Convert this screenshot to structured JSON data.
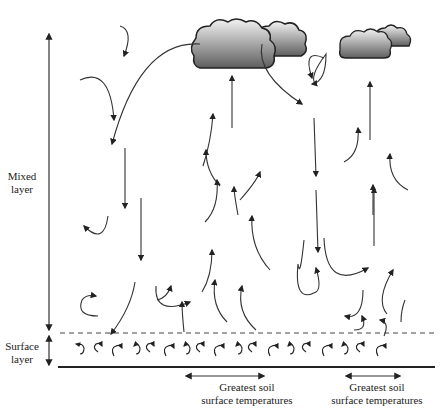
{
  "diagram": {
    "labels": {
      "mixed_layer": "Mixed layer",
      "mixed_layer_line1": "Mixed",
      "mixed_layer_line2": "layer",
      "surface_layer_line1": "Surface",
      "surface_layer_line2": "layer",
      "hotspot_1_line1": "Greatest soil",
      "hotspot_1_line2": "surface temperatures",
      "hotspot_2_line1": "Greatest soil",
      "hotspot_2_line2": "surface temperatures"
    },
    "elements": {
      "clouds": [
        {
          "name": "large-cumulus-cloud",
          "position": "top-center"
        },
        {
          "name": "small-cumulus-cloud",
          "position": "top-right"
        }
      ],
      "surface_eddies_count": 18,
      "boundary_line": "dashed",
      "ground_line": "solid"
    },
    "colors": {
      "line": "#333333",
      "cloud_light": "#e8e8e8",
      "cloud_dark": "#6a6a6a",
      "cloud_outline": "#222222"
    }
  }
}
